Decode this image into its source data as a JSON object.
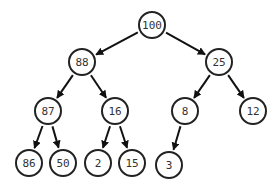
{
  "diagram": {
    "type": "binary-tree",
    "title": "",
    "node_radius": 13,
    "colors": {
      "stroke": "#222222",
      "fill": "#ffffff",
      "text": "#333333",
      "edge": "#111111"
    },
    "nodes": [
      {
        "id": "n100",
        "label": "100",
        "x": 152,
        "y": 25
      },
      {
        "id": "n88",
        "label": "88",
        "x": 82,
        "y": 62
      },
      {
        "id": "n25",
        "label": "25",
        "x": 219,
        "y": 62
      },
      {
        "id": "n87",
        "label": "87",
        "x": 48,
        "y": 111
      },
      {
        "id": "n16",
        "label": "16",
        "x": 115,
        "y": 111
      },
      {
        "id": "n8",
        "label": "8",
        "x": 185,
        "y": 111
      },
      {
        "id": "n12",
        "label": "12",
        "x": 253,
        "y": 111
      },
      {
        "id": "n86",
        "label": "86",
        "x": 29,
        "y": 163
      },
      {
        "id": "n50",
        "label": "50",
        "x": 63,
        "y": 163
      },
      {
        "id": "n2",
        "label": "2",
        "x": 98,
        "y": 163
      },
      {
        "id": "n15",
        "label": "15",
        "x": 132,
        "y": 163
      },
      {
        "id": "n3",
        "label": "3",
        "x": 169,
        "y": 165
      }
    ],
    "edges": [
      {
        "from": "n100",
        "to": "n88"
      },
      {
        "from": "n100",
        "to": "n25"
      },
      {
        "from": "n88",
        "to": "n87"
      },
      {
        "from": "n88",
        "to": "n16"
      },
      {
        "from": "n25",
        "to": "n8"
      },
      {
        "from": "n25",
        "to": "n12"
      },
      {
        "from": "n87",
        "to": "n86"
      },
      {
        "from": "n87",
        "to": "n50"
      },
      {
        "from": "n16",
        "to": "n2"
      },
      {
        "from": "n16",
        "to": "n15"
      },
      {
        "from": "n8",
        "to": "n3"
      }
    ]
  }
}
